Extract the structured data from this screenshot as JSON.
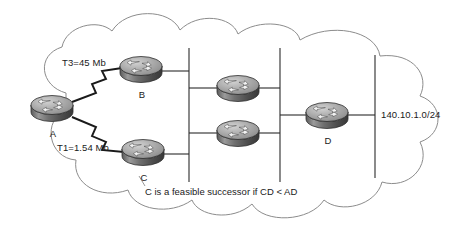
{
  "diagram": {
    "caption": "C is a feasible successor if CD < AD",
    "cloud": {
      "name": "network-cloud",
      "stroke": "#8c8c8c",
      "fill": "#ffffff"
    },
    "routers": [
      {
        "id": "A",
        "label": "A",
        "x": 52,
        "y": 108,
        "name": "router-a"
      },
      {
        "id": "B",
        "label": "B",
        "x": 141,
        "y": 69,
        "name": "router-b"
      },
      {
        "id": "C",
        "label": "C",
        "x": 143,
        "y": 152,
        "name": "router-c"
      },
      {
        "id": "M1",
        "label": "",
        "x": 238,
        "y": 88,
        "name": "router-core-upper"
      },
      {
        "id": "M2",
        "label": "",
        "x": 238,
        "y": 133,
        "name": "router-core-lower"
      },
      {
        "id": "D",
        "label": "D",
        "x": 327,
        "y": 115,
        "name": "router-d"
      }
    ],
    "links": [
      {
        "from": "A",
        "to": "B",
        "type": "serial-zigzag",
        "label": "T3=45 Mb",
        "name": "link-a-b"
      },
      {
        "from": "A",
        "to": "C",
        "type": "serial-zigzag",
        "label": "T1=1.54 Mb",
        "name": "link-a-c"
      }
    ],
    "link_labels": [
      {
        "text": "T3=45 Mb",
        "x": 62,
        "y": 63,
        "name": "link-label-t3"
      },
      {
        "text": "T1=1.54 Mb",
        "x": 57,
        "y": 148,
        "name": "link-label-t1"
      }
    ],
    "buses": [
      {
        "x": 189,
        "y1": 48,
        "y2": 182,
        "name": "bus-left"
      },
      {
        "x": 280,
        "y1": 48,
        "y2": 182,
        "name": "bus-middle"
      },
      {
        "x": 375,
        "y1": 55,
        "y2": 178,
        "name": "bus-right"
      }
    ],
    "network_label": {
      "text": "140.10.1.0/24",
      "x": 381,
      "y": 110,
      "name": "network-address-label"
    },
    "colors": {
      "router_top": "#b4b4b4",
      "router_body": "#6e6e6e",
      "router_outline": "#3a3a3a",
      "line": "#2b2b2b",
      "cloud_stroke": "#8c8c8c",
      "text": "#1a1a1a"
    }
  }
}
